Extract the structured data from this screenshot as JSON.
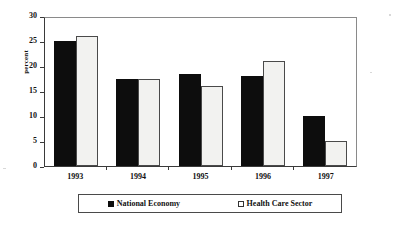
{
  "chart_data": {
    "type": "bar",
    "title": "",
    "xlabel": "",
    "ylabel": "percent",
    "ylim": [
      0,
      30
    ],
    "ytick_step": 5,
    "yticks": [
      30,
      25,
      20,
      15,
      10,
      5,
      0
    ],
    "grid": false,
    "legend_position": "bottom",
    "categories": [
      "1993",
      "1994",
      "1995",
      "1996",
      "1997"
    ],
    "series": [
      {
        "name": "National Economy",
        "marker": "filled-square",
        "color": "#0d0d0d",
        "values": [
          25,
          17.5,
          18.5,
          18,
          10
        ]
      },
      {
        "name": "Health Care Sector",
        "marker": "open-square",
        "color": "#ffffff",
        "values": [
          26,
          17.5,
          16,
          21,
          5
        ]
      }
    ]
  },
  "axis": {
    "y_title": "percent",
    "y_tick_labels": [
      "30",
      "25",
      "20",
      "15",
      "10",
      "5",
      "0"
    ],
    "x_tick_labels": [
      "1993",
      "1994",
      "1995",
      "1996",
      "1997"
    ]
  },
  "legend": {
    "entries": [
      {
        "label": "National Economy",
        "swatch": "filled-square"
      },
      {
        "label": "Health Care Sector",
        "swatch": "open-square"
      }
    ]
  }
}
